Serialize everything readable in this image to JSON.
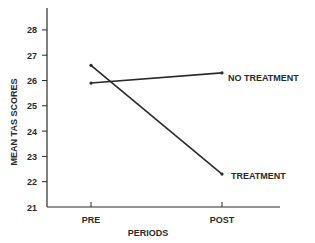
{
  "chart_data": {
    "type": "line",
    "title": "",
    "xlabel": "PERIODS",
    "ylabel": "MEAN TAS SCORES",
    "categories": [
      "PRE",
      "POST"
    ],
    "series": [
      {
        "name": "NO TREATMENT",
        "values": [
          25.9,
          26.3
        ]
      },
      {
        "name": "TREATMENT",
        "values": [
          26.6,
          22.3
        ]
      }
    ],
    "ylim": [
      21,
      28
    ],
    "yticks": [
      "21",
      "22",
      "23",
      "24",
      "25",
      "26",
      "27",
      "28"
    ],
    "grid": false,
    "legend_position": "inline-right"
  }
}
